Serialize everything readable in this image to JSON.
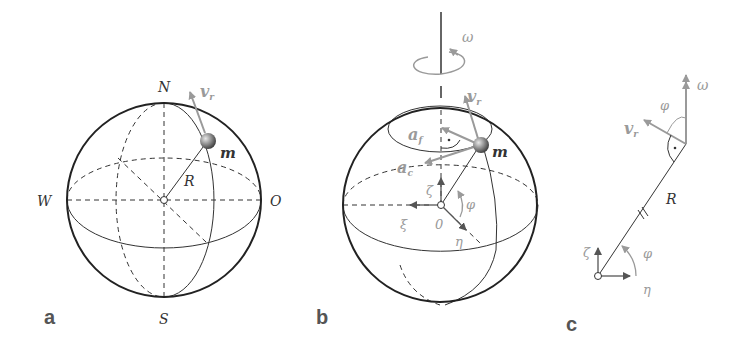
{
  "figure": {
    "panels": [
      {
        "id": "a",
        "label": "a",
        "labels": {
          "north": "N",
          "south": "S",
          "west": "W",
          "east": "O",
          "mass": "m",
          "radius": "R",
          "velocity": "v",
          "velocity_sub": "r"
        }
      },
      {
        "id": "b",
        "label": "b",
        "labels": {
          "omega": "ω",
          "velocity": "v",
          "velocity_sub": "r",
          "a_f": "a",
          "a_f_sub": "f",
          "a_c": "a",
          "a_c_sub": "c",
          "mass": "m",
          "zeta": "ζ",
          "xi": "ξ",
          "eta": "η",
          "phi": "φ",
          "origin": "0"
        }
      },
      {
        "id": "c",
        "label": "c",
        "labels": {
          "omega": "ω",
          "phi_top": "φ",
          "velocity": "v",
          "velocity_sub": "r",
          "radius": "R",
          "zeta": "ζ",
          "eta": "η",
          "phi_bottom": "φ"
        }
      }
    ],
    "colors": {
      "line": "#333333",
      "vector_gray": "#9a9a9a",
      "sphere_outline": "#222222"
    }
  }
}
